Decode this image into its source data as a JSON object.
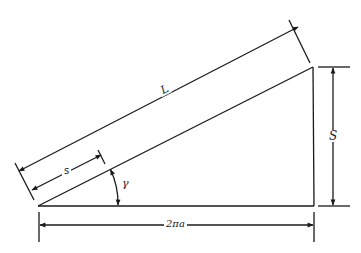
{
  "diagram": {
    "type": "dimensioned right triangle (helix unrolled)",
    "colors": {
      "line": "#1a1a1a",
      "background": "#ffffff"
    },
    "labels": {
      "hypotenuse_length": "L",
      "partial_length": "s",
      "height": "S",
      "base": "2πa",
      "angle": "γ"
    }
  }
}
